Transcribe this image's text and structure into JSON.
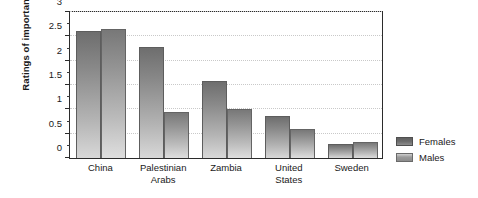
{
  "chart_data": {
    "type": "bar",
    "title": "",
    "subtitle": "",
    "xlabel": "",
    "ylabel": "Ratings of importance",
    "categories": [
      "China",
      "Palestinian Arabs",
      "Zambia",
      "United States",
      "Sweden"
    ],
    "category_lines": [
      [
        "China"
      ],
      [
        "Palestinian",
        "Arabs"
      ],
      [
        "Zambia"
      ],
      [
        "United",
        "States"
      ],
      [
        "Sweden"
      ]
    ],
    "series": [
      {
        "name": "Females",
        "color": "#6e6e6e",
        "values": [
          2.6,
          2.28,
          1.58,
          0.87,
          0.28
        ]
      },
      {
        "name": "Males",
        "color": "#a8a8a8",
        "values": [
          2.65,
          0.95,
          1.0,
          0.6,
          0.33
        ]
      }
    ],
    "ylim": [
      0,
      3
    ],
    "yticks": [
      0,
      0.5,
      1,
      1.5,
      2,
      2.5,
      3
    ],
    "ytick_labels": [
      "0",
      "0.5",
      "1",
      "1.5",
      "2",
      "2.5",
      "3"
    ],
    "y_minor_ticks": [
      0.25,
      0.75,
      1.25,
      1.75,
      2.25,
      2.75
    ],
    "grid": true,
    "grid_axis": "y",
    "grid_style": "dotted",
    "legend_position": "right",
    "legend_entries": [
      "Females",
      "Males"
    ],
    "bar_grouping": "grouped",
    "frame": true,
    "background_color": "#ffffff"
  }
}
